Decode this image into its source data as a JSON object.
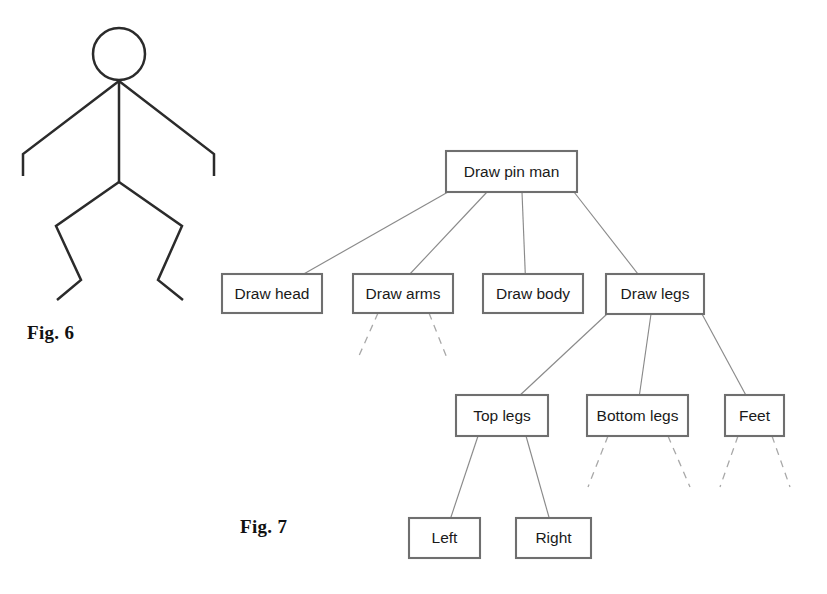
{
  "page": {
    "background_color": "#ffffff",
    "width": 827,
    "height": 594
  },
  "figure6": {
    "caption": "Fig. 6",
    "description": "pin-man stick figure drawing",
    "stroke_color": "#2b2b2b",
    "parts": [
      "head",
      "arms",
      "body",
      "legs"
    ]
  },
  "figure7": {
    "caption": "Fig. 7",
    "description": "hierarchical decomposition tree for drawing a pin man",
    "box_stroke_color": "#6f6f6f",
    "connector_color": "#8a8a8a",
    "dashed_connector_color": "#a8a8a8",
    "nodes": {
      "root": "Draw pin man",
      "head": "Draw head",
      "arms": "Draw arms",
      "body": "Draw body",
      "legs": "Draw legs",
      "top_legs": "Top legs",
      "bottom_legs": "Bottom legs",
      "feet": "Feet",
      "left": "Left",
      "right": "Right"
    },
    "levels": [
      [
        "Draw pin man"
      ],
      [
        "Draw head",
        "Draw arms",
        "Draw body",
        "Draw legs"
      ],
      [
        "Top legs",
        "Bottom legs",
        "Feet"
      ],
      [
        "Left",
        "Right"
      ]
    ],
    "edges": [
      [
        "Draw pin man",
        "Draw head"
      ],
      [
        "Draw pin man",
        "Draw arms"
      ],
      [
        "Draw pin man",
        "Draw body"
      ],
      [
        "Draw pin man",
        "Draw legs"
      ],
      [
        "Draw legs",
        "Top legs"
      ],
      [
        "Draw legs",
        "Bottom legs"
      ],
      [
        "Draw legs",
        "Feet"
      ],
      [
        "Top legs",
        "Left"
      ],
      [
        "Top legs",
        "Right"
      ]
    ],
    "unexpanded_nodes": [
      "Draw arms",
      "Bottom legs",
      "Feet"
    ]
  }
}
